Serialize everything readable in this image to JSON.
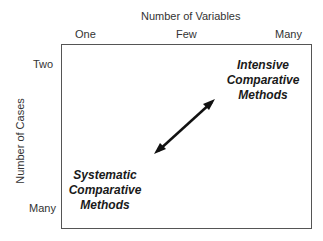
{
  "x_axis": {
    "title": "Number of Variables",
    "ticks": [
      "One",
      "Few",
      "Many"
    ]
  },
  "y_axis": {
    "title": "Number of Cases",
    "ticks": [
      "Two",
      "Many"
    ]
  },
  "methods": {
    "intensive": [
      "Intensive",
      "Comparative",
      "Methods"
    ],
    "systematic": [
      "Systematic",
      "Comparative",
      "Methods"
    ]
  },
  "arrow": {
    "type": "double-headed",
    "color": "#111111"
  }
}
